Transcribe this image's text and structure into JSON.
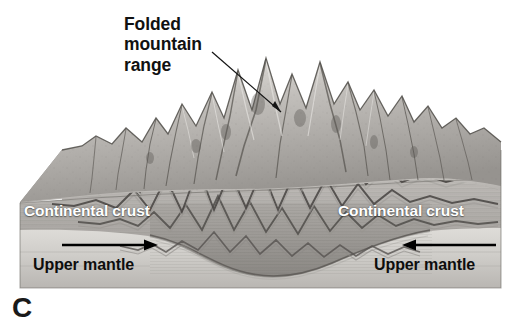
{
  "figure": {
    "panel_letter": "C",
    "background_color": "#ffffff",
    "caption_callout": "Folded\nmountain\nrange",
    "callout_lines": [
      "Folded",
      "mountain",
      "range"
    ],
    "labels": {
      "crust_left": "Continental crust",
      "crust_right": "Continental crust",
      "mantle_left": "Upper mantle",
      "mantle_right": "Upper mantle"
    },
    "label_colors": {
      "crust_text": "#ffffff",
      "mantle_text": "#0d0d0d",
      "callout_text": "#111111",
      "leader_line": "#1a1a1a",
      "arrow": "#000000"
    },
    "arrows": [
      {
        "name": "left-convergence-arrow",
        "direction": "right",
        "x1": 62,
        "x2": 156,
        "y": 245
      },
      {
        "name": "right-convergence-arrow",
        "direction": "left",
        "x1": 496,
        "x2": 404,
        "y": 245
      }
    ],
    "leader": {
      "from_x": 212,
      "from_y": 52,
      "to_x": 281,
      "to_y": 112
    },
    "block": {
      "left": 20,
      "right": 501,
      "top_surface_y": 148,
      "bottom_y": 288,
      "chamfer_x": 62,
      "chamfer_y": 200,
      "crust_base_y": 228,
      "root_depth_y": 276,
      "fill_light": "#d8d6d2",
      "fill_mid": "#b3b0ac",
      "fill_dark": "#8d8a86",
      "mantle_fill": "#cfcdc9"
    },
    "geology": {
      "mountain_peak_count": 9,
      "fold_layer_count": 4,
      "structure": "continental-continental collision, folded mountain range with crustal root"
    }
  }
}
